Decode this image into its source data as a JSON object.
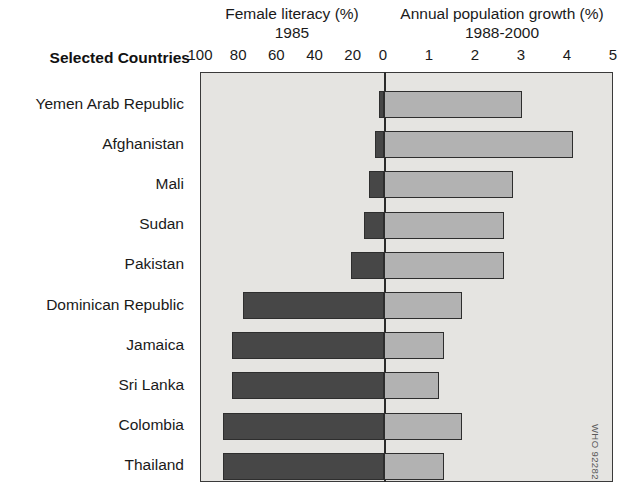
{
  "header": {
    "left_title": "Female literacy (%)",
    "left_subtitle": "1985",
    "right_title": "Annual population growth (%)",
    "right_subtitle": "1988-2000"
  },
  "row_header": "Selected Countries",
  "credit": "WHO 92282",
  "colors": {
    "left_bar": "#474747",
    "right_bar": "#b2b2b2",
    "plot_background": "#e5e4e1",
    "axis": "#2e2e2e"
  },
  "chart_data": {
    "type": "bar",
    "orientation": "horizontal",
    "style": "back-to-back bidirectional bar chart",
    "xlabel": "",
    "ylabel": "Selected Countries",
    "grid": false,
    "legend_position": "none",
    "categories": [
      "Yemen Arab Republic",
      "Afghanistan",
      "Mali",
      "Sudan",
      "Pakistan",
      "Dominican Republic",
      "Jamaica",
      "Sri Lanka",
      "Colombia",
      "Thailand"
    ],
    "series": [
      {
        "name": "Female literacy (%)",
        "subtitle": "1985",
        "axis": "left",
        "direction": "left",
        "axis_max": 100,
        "axis_min": 0,
        "axis_ticks": [
          100,
          80,
          60,
          40,
          20,
          0
        ],
        "units": "%",
        "color": "#474747",
        "values": [
          3,
          5,
          8,
          11,
          18,
          77,
          83,
          83,
          88,
          88
        ]
      },
      {
        "name": "Annual population growth (%)",
        "subtitle": "1988-2000",
        "axis": "right",
        "direction": "right",
        "axis_min": 0,
        "axis_max": 5,
        "axis_ticks": [
          0,
          1,
          2,
          3,
          4,
          5
        ],
        "units": "%",
        "color": "#b2b2b2",
        "values": [
          3.0,
          4.1,
          2.8,
          2.6,
          2.6,
          1.7,
          1.3,
          1.2,
          1.7,
          1.3
        ]
      }
    ],
    "axis_tick_labels": [
      "100",
      "80",
      "60",
      "40",
      "20",
      "0",
      "1",
      "2",
      "3",
      "4",
      "5"
    ],
    "axis_tick_positions_fraction": [
      0.0,
      0.0924,
      0.1848,
      0.2772,
      0.3696,
      0.4431,
      0.5545,
      0.6659,
      0.7773,
      0.8886,
      1.0
    ]
  }
}
